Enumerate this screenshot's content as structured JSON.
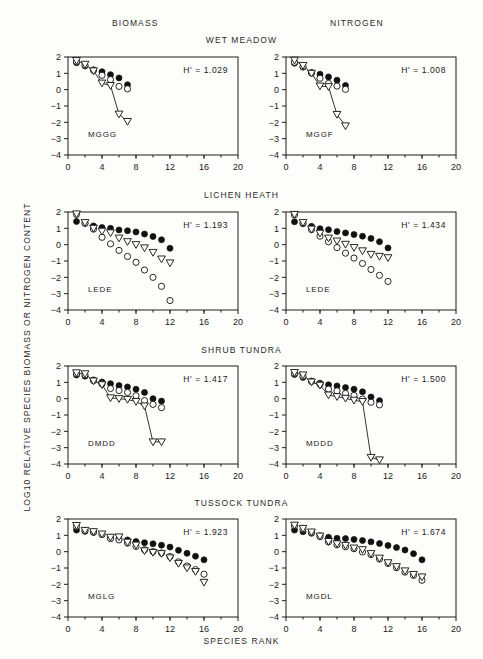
{
  "figure": {
    "column_headers": [
      "BIOMASS",
      "NITROGEN"
    ],
    "row_headers": [
      "WET  MEADOW",
      "LICHEN  HEATH",
      "SHRUB  TUNDRA",
      "TUSSOCK  TUNDRA"
    ],
    "y_axis_title": "LOG10  RELATIVE  SPECIES  BIOMASS  OR  NITROGEN  CONTENT",
    "x_axis_title": "SPECIES  RANK"
  },
  "axes": {
    "x_ticks": [
      "0",
      "4",
      "8",
      "12",
      "16",
      "20"
    ],
    "y_ticks": [
      "2",
      "1",
      "0",
      "-1",
      "-2",
      "-3",
      "-4"
    ],
    "xlim": [
      0,
      20
    ],
    "ylim": [
      -4,
      2
    ]
  },
  "chart_data": [
    {
      "type": "scatter",
      "title": "WET  MEADOW",
      "column": "BIOMASS",
      "code": "MGGG",
      "annotation": "H'  =  1.029",
      "h_prime": 1.029,
      "xlabel": "SPECIES  RANK",
      "ylabel": "LOG10  RELATIVE  SPECIES  BIOMASS  OR  NITROGEN  CONTENT",
      "xlim": [
        0,
        20
      ],
      "ylim": [
        -4,
        2
      ],
      "grid": false,
      "legend": "none",
      "x": [
        1,
        2,
        3,
        4,
        5,
        6,
        7
      ],
      "series": [
        {
          "name": "filled-circle",
          "marker": "filled-circle",
          "connected": false,
          "values": [
            1.65,
            1.45,
            1.22,
            1.1,
            0.92,
            0.72,
            0.3
          ]
        },
        {
          "name": "open-circle",
          "marker": "open-circle",
          "connected": false,
          "values": [
            1.72,
            1.5,
            1.18,
            0.88,
            0.62,
            0.2,
            0.05
          ]
        },
        {
          "name": "open-triangle",
          "marker": "open-triangle",
          "connected": true,
          "values": [
            1.78,
            1.55,
            1.15,
            0.4,
            0.25,
            -1.5,
            -1.95
          ]
        }
      ]
    },
    {
      "type": "scatter",
      "title": "WET  MEADOW",
      "column": "NITROGEN",
      "code": "MGGF",
      "annotation": "H'  =  1.008",
      "h_prime": 1.008,
      "xlabel": "SPECIES  RANK",
      "ylabel": "LOG10  RELATIVE  SPECIES  BIOMASS  OR  NITROGEN  CONTENT",
      "xlim": [
        0,
        20
      ],
      "ylim": [
        -4,
        2
      ],
      "grid": false,
      "legend": "none",
      "x": [
        1,
        2,
        3,
        4,
        5,
        6,
        7
      ],
      "series": [
        {
          "name": "filled-circle",
          "marker": "filled-circle",
          "connected": false,
          "values": [
            1.62,
            1.38,
            1.05,
            0.95,
            0.78,
            0.58,
            0.26
          ]
        },
        {
          "name": "open-circle",
          "marker": "open-circle",
          "connected": false,
          "values": [
            1.68,
            1.42,
            1.02,
            0.7,
            0.38,
            0.22,
            0.02
          ]
        },
        {
          "name": "open-triangle",
          "marker": "open-triangle",
          "connected": true,
          "values": [
            1.8,
            1.48,
            1.0,
            0.22,
            0.18,
            -1.52,
            -2.22
          ]
        }
      ]
    },
    {
      "type": "scatter",
      "title": "LICHEN  HEATH",
      "column": "BIOMASS",
      "code": "LEDE",
      "annotation": "H'  =  1.193",
      "h_prime": 1.193,
      "xlabel": "SPECIES  RANK",
      "ylabel": "LOG10  RELATIVE  SPECIES  BIOMASS  OR  NITROGEN  CONTENT",
      "xlim": [
        0,
        20
      ],
      "ylim": [
        -4,
        2
      ],
      "grid": false,
      "legend": "none",
      "x": [
        1,
        2,
        3,
        4,
        5,
        6,
        7,
        8,
        9,
        10,
        11,
        12
      ],
      "series": [
        {
          "name": "filled-circle",
          "marker": "filled-circle",
          "connected": false,
          "values": [
            1.42,
            1.32,
            1.15,
            1.05,
            1.0,
            0.9,
            0.85,
            0.78,
            0.65,
            0.5,
            0.3,
            -0.22
          ]
        },
        {
          "name": "open-circle",
          "marker": "open-circle",
          "connected": false,
          "values": [
            1.85,
            1.3,
            0.95,
            0.45,
            0.05,
            -0.35,
            -0.72,
            -1.08,
            -1.55,
            -2.0,
            -2.55,
            -3.42
          ]
        },
        {
          "name": "open-triangle",
          "marker": "open-triangle",
          "connected": false,
          "values": [
            1.88,
            1.35,
            1.0,
            0.82,
            0.72,
            0.4,
            0.18,
            0.0,
            -0.2,
            -0.48,
            -0.88,
            -1.12
          ]
        }
      ]
    },
    {
      "type": "scatter",
      "title": "LICHEN  HEATH",
      "column": "NITROGEN",
      "code": "LEDE",
      "annotation": "H'  =  1.434",
      "h_prime": 1.434,
      "xlabel": "SPECIES  RANK",
      "ylabel": "LOG10  RELATIVE  SPECIES  BIOMASS  OR  NITROGEN  CONTENT",
      "xlim": [
        0,
        20
      ],
      "ylim": [
        -4,
        2
      ],
      "grid": false,
      "legend": "none",
      "x": [
        1,
        2,
        3,
        4,
        5,
        6,
        7,
        8,
        9,
        10,
        11,
        12
      ],
      "series": [
        {
          "name": "filled-circle",
          "marker": "filled-circle",
          "connected": false,
          "values": [
            1.4,
            1.28,
            1.12,
            0.98,
            0.92,
            0.8,
            0.72,
            0.62,
            0.52,
            0.38,
            0.18,
            -0.2
          ]
        },
        {
          "name": "open-circle",
          "marker": "open-circle",
          "connected": false,
          "values": [
            1.82,
            1.32,
            0.92,
            0.52,
            0.18,
            -0.18,
            -0.52,
            -0.82,
            -1.15,
            -1.52,
            -1.88,
            -2.25
          ]
        },
        {
          "name": "open-triangle",
          "marker": "open-triangle",
          "connected": false,
          "values": [
            1.85,
            1.35,
            0.95,
            0.7,
            0.4,
            0.22,
            0.02,
            -0.18,
            -0.38,
            -0.6,
            -0.72,
            -0.8
          ]
        }
      ]
    },
    {
      "type": "scatter",
      "title": "SHRUB  TUNDRA",
      "column": "BIOMASS",
      "code": "DMDD",
      "annotation": "H'  =  1.417",
      "h_prime": 1.417,
      "xlabel": "SPECIES  RANK",
      "ylabel": "LOG10  RELATIVE  SPECIES  BIOMASS  OR  NITROGEN  CONTENT",
      "xlim": [
        0,
        20
      ],
      "ylim": [
        -4,
        2
      ],
      "grid": false,
      "legend": "none",
      "x": [
        1,
        2,
        3,
        4,
        5,
        6,
        7,
        8,
        9,
        10,
        11
      ],
      "series": [
        {
          "name": "filled-circle",
          "marker": "filled-circle",
          "connected": false,
          "values": [
            1.45,
            1.38,
            1.15,
            1.02,
            0.92,
            0.8,
            0.72,
            0.58,
            0.38,
            0.0,
            -0.15
          ]
        },
        {
          "name": "open-circle",
          "marker": "open-circle",
          "connected": false,
          "values": [
            1.52,
            1.45,
            1.1,
            0.9,
            0.62,
            0.5,
            0.38,
            0.18,
            -0.12,
            -0.35,
            -0.55
          ]
        },
        {
          "name": "open-triangle",
          "marker": "open-triangle",
          "connected": true,
          "values": [
            1.58,
            1.52,
            1.08,
            0.85,
            0.05,
            0.0,
            -0.05,
            -0.18,
            -0.45,
            -2.65,
            -2.65
          ]
        }
      ]
    },
    {
      "type": "scatter",
      "title": "SHRUB  TUNDRA",
      "column": "NITROGEN",
      "code": "MDDD",
      "annotation": "H'  =  1.500",
      "h_prime": 1.5,
      "xlabel": "SPECIES  RANK",
      "ylabel": "LOG10  RELATIVE  SPECIES  BIOMASS  OR  NITROGEN  CONTENT",
      "xlim": [
        0,
        20
      ],
      "ylim": [
        -4,
        2
      ],
      "grid": false,
      "legend": "none",
      "x": [
        1,
        2,
        3,
        4,
        5,
        6,
        7,
        8,
        9,
        10,
        11
      ],
      "series": [
        {
          "name": "filled-circle",
          "marker": "filled-circle",
          "connected": false,
          "values": [
            1.48,
            1.3,
            1.08,
            0.95,
            0.85,
            0.78,
            0.68,
            0.58,
            0.42,
            0.1,
            -0.12
          ]
        },
        {
          "name": "open-circle",
          "marker": "open-circle",
          "connected": false,
          "values": [
            1.55,
            1.38,
            1.05,
            0.88,
            0.58,
            0.48,
            0.32,
            0.2,
            -0.02,
            -0.22,
            -0.38
          ]
        },
        {
          "name": "open-triangle",
          "marker": "open-triangle",
          "connected": true,
          "values": [
            1.6,
            1.45,
            1.02,
            0.82,
            0.22,
            0.12,
            0.02,
            -0.1,
            -0.18,
            -3.6,
            -3.75
          ]
        }
      ]
    },
    {
      "type": "scatter",
      "title": "TUSSOCK  TUNDRA",
      "column": "BIOMASS",
      "code": "MGLG",
      "annotation": "H'  =  1.923",
      "h_prime": 1.923,
      "xlabel": "SPECIES  RANK",
      "ylabel": "LOG10  RELATIVE  SPECIES  BIOMASS  OR  NITROGEN  CONTENT",
      "xlim": [
        0,
        20
      ],
      "ylim": [
        -4,
        2
      ],
      "grid": false,
      "legend": "none",
      "x": [
        1,
        2,
        3,
        4,
        5,
        6,
        7,
        8,
        9,
        10,
        11,
        12,
        13,
        14,
        15,
        16
      ],
      "series": [
        {
          "name": "filled-circle",
          "marker": "filled-circle",
          "connected": false,
          "values": [
            1.32,
            1.25,
            1.18,
            1.05,
            0.85,
            0.8,
            0.72,
            0.62,
            0.55,
            0.48,
            0.4,
            0.28,
            0.08,
            -0.1,
            -0.28,
            -0.5
          ]
        },
        {
          "name": "open-circle",
          "marker": "open-circle",
          "connected": false,
          "values": [
            1.55,
            1.28,
            1.2,
            1.05,
            0.8,
            0.72,
            0.52,
            0.32,
            0.12,
            0.0,
            -0.08,
            -0.3,
            -0.62,
            -0.88,
            -1.1,
            -1.38
          ]
        },
        {
          "name": "open-triangle",
          "marker": "open-triangle",
          "connected": false,
          "values": [
            1.6,
            1.3,
            1.22,
            1.08,
            0.88,
            0.9,
            0.58,
            0.4,
            0.05,
            -0.05,
            -0.12,
            -0.38,
            -0.72,
            -1.0,
            -1.22,
            -1.88
          ]
        }
      ]
    },
    {
      "type": "scatter",
      "title": "TUSSOCK  TUNDRA",
      "column": "NITROGEN",
      "code": "MGDL",
      "annotation": "H'  =  1.674",
      "h_prime": 1.674,
      "xlabel": "SPECIES  RANK",
      "ylabel": "LOG10  RELATIVE  SPECIES  BIOMASS  OR  NITROGEN  CONTENT",
      "xlim": [
        0,
        20
      ],
      "ylim": [
        -4,
        2
      ],
      "grid": false,
      "legend": "none",
      "x": [
        1,
        2,
        3,
        4,
        5,
        6,
        7,
        8,
        9,
        10,
        11,
        12,
        13,
        14,
        15,
        16
      ],
      "series": [
        {
          "name": "filled-circle",
          "marker": "filled-circle",
          "connected": false,
          "values": [
            1.32,
            1.22,
            1.12,
            0.98,
            0.88,
            0.82,
            0.8,
            0.75,
            0.68,
            0.6,
            0.5,
            0.38,
            0.25,
            0.1,
            -0.12,
            -0.5
          ]
        },
        {
          "name": "open-circle",
          "marker": "open-circle",
          "connected": false,
          "values": [
            1.58,
            1.38,
            1.18,
            0.92,
            0.6,
            0.42,
            0.3,
            0.18,
            -0.02,
            -0.18,
            -0.45,
            -0.72,
            -0.98,
            -1.25,
            -1.45,
            -1.75
          ]
        },
        {
          "name": "open-triangle",
          "marker": "open-triangle",
          "connected": false,
          "values": [
            1.62,
            1.42,
            1.2,
            0.95,
            0.62,
            0.48,
            0.38,
            0.22,
            0.12,
            -0.12,
            -0.4,
            -0.68,
            -0.92,
            -1.18,
            -1.4,
            -1.55
          ]
        }
      ]
    }
  ]
}
